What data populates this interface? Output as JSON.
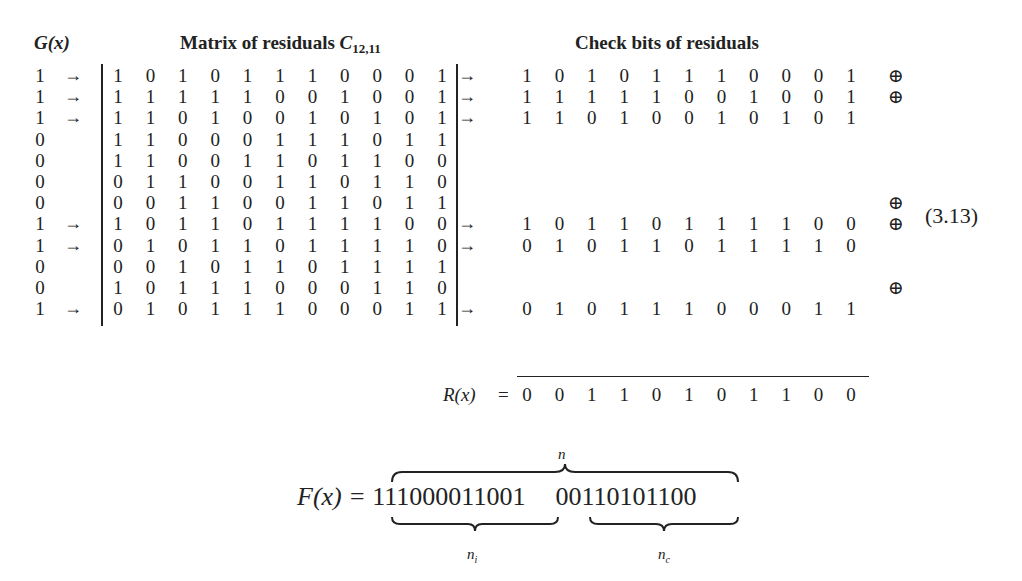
{
  "headers": {
    "g_label": "G(x)",
    "matrix_label": "Matrix of residuals ",
    "matrix_symbol": "C",
    "matrix_subscript": "12,11",
    "check_label": "Check bits of residuals"
  },
  "g_column": [
    "1",
    "1",
    "1",
    "0",
    "0",
    "0",
    "0",
    "1",
    "1",
    "0",
    "0",
    "1"
  ],
  "selected_rows": [
    0,
    1,
    2,
    7,
    8,
    11
  ],
  "matrix": [
    [
      "1",
      "0",
      "1",
      "0",
      "1",
      "1",
      "1",
      "0",
      "0",
      "0",
      "1"
    ],
    [
      "1",
      "1",
      "1",
      "1",
      "1",
      "0",
      "0",
      "1",
      "0",
      "0",
      "1"
    ],
    [
      "1",
      "1",
      "0",
      "1",
      "0",
      "0",
      "1",
      "0",
      "1",
      "0",
      "1"
    ],
    [
      "1",
      "1",
      "0",
      "0",
      "0",
      "1",
      "1",
      "1",
      "0",
      "1",
      "1"
    ],
    [
      "1",
      "1",
      "0",
      "0",
      "1",
      "1",
      "0",
      "1",
      "1",
      "0",
      "0"
    ],
    [
      "0",
      "1",
      "1",
      "0",
      "0",
      "1",
      "1",
      "0",
      "1",
      "1",
      "0"
    ],
    [
      "0",
      "0",
      "1",
      "1",
      "0",
      "0",
      "1",
      "1",
      "0",
      "1",
      "1"
    ],
    [
      "1",
      "0",
      "1",
      "1",
      "0",
      "1",
      "1",
      "1",
      "1",
      "0",
      "0"
    ],
    [
      "0",
      "1",
      "0",
      "1",
      "1",
      "0",
      "1",
      "1",
      "1",
      "1",
      "0"
    ],
    [
      "0",
      "0",
      "1",
      "0",
      "1",
      "1",
      "0",
      "1",
      "1",
      "1",
      "1"
    ],
    [
      "1",
      "0",
      "1",
      "1",
      "1",
      "0",
      "0",
      "0",
      "1",
      "1",
      "0"
    ],
    [
      "0",
      "1",
      "0",
      "1",
      "1",
      "1",
      "0",
      "0",
      "0",
      "1",
      "1"
    ]
  ],
  "check_rows": [
    {
      "row": 0,
      "bits": [
        "1",
        "0",
        "1",
        "0",
        "1",
        "1",
        "1",
        "0",
        "0",
        "0",
        "1"
      ],
      "oplus": true
    },
    {
      "row": 1,
      "bits": [
        "1",
        "1",
        "1",
        "1",
        "1",
        "0",
        "0",
        "1",
        "0",
        "0",
        "1"
      ],
      "oplus": true
    },
    {
      "row": 2,
      "bits": [
        "1",
        "1",
        "0",
        "1",
        "0",
        "0",
        "1",
        "0",
        "1",
        "0",
        "1"
      ],
      "oplus": false
    },
    {
      "row": 7,
      "bits": [
        "1",
        "0",
        "1",
        "1",
        "0",
        "1",
        "1",
        "1",
        "1",
        "0",
        "0"
      ],
      "oplus": true
    },
    {
      "row": 8,
      "bits": [
        "0",
        "1",
        "0",
        "1",
        "1",
        "0",
        "1",
        "1",
        "1",
        "1",
        "0"
      ],
      "oplus": false
    },
    {
      "row": 11,
      "bits": [
        "0",
        "1",
        "0",
        "1",
        "1",
        "1",
        "0",
        "0",
        "0",
        "1",
        "1"
      ],
      "oplus": false
    }
  ],
  "extra_oplus_rows": [
    6,
    10
  ],
  "arrow_glyph": "→",
  "bar_arrow_glyph": "↦",
  "oplus_glyph": "⊕",
  "equation_number": "(3.13)",
  "result": {
    "label": "R(x)",
    "equals": "=",
    "bits": [
      "0",
      "0",
      "1",
      "1",
      "0",
      "1",
      "0",
      "1",
      "1",
      "0",
      "0"
    ]
  },
  "codeword": {
    "lhs": "F(x) = ",
    "info_bits": "111000011001",
    "check_bits": "00110101100",
    "n_label": "n",
    "ni_label": "n",
    "ni_sub": "i",
    "nc_label": "n",
    "nc_sub": "c"
  }
}
